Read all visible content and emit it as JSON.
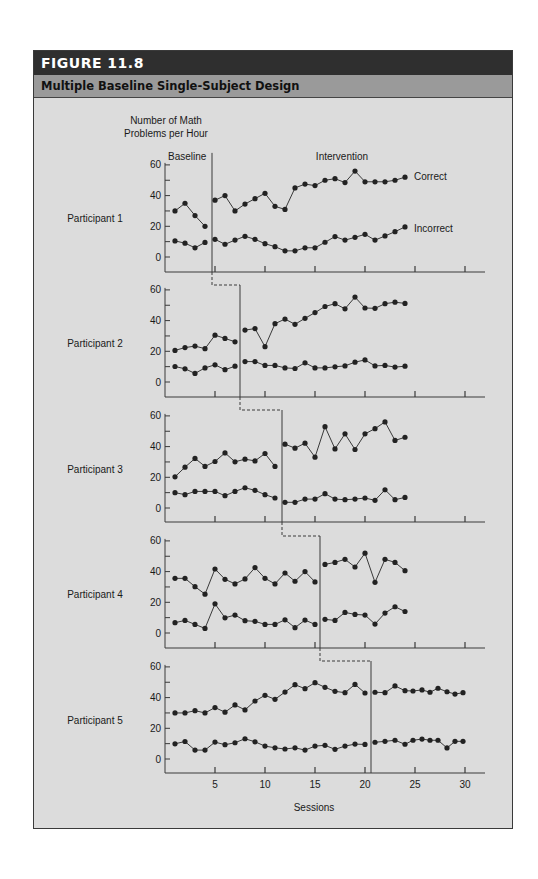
{
  "figure": {
    "number_label": "FIGURE  11.8",
    "title": "Multiple Baseline Single-Subject Design"
  },
  "chart_data": {
    "type": "line",
    "title": "Multiple Baseline Single-Subject Design",
    "ylabel": "Number of Math Problems per Hour",
    "ylabel_lines": [
      "Number of Math",
      "Problems per Hour"
    ],
    "xlabel": "Sessions",
    "xticks": [
      5,
      10,
      15,
      20,
      25,
      30
    ],
    "yticks": [
      0,
      20,
      40,
      60
    ],
    "ylim": [
      0,
      60
    ],
    "xlim": [
      0,
      32
    ],
    "grid": false,
    "phase_labels": [
      "Baseline",
      "Intervention"
    ],
    "series_labels": [
      "Correct",
      "Incorrect"
    ],
    "panels": [
      {
        "label": "Participant 1",
        "phase_change_after_session": 4.7,
        "correct": {
          "baseline": [
            [
              1,
              30
            ],
            [
              2,
              35
            ],
            [
              3,
              27
            ],
            [
              4,
              20
            ]
          ],
          "intervention": [
            [
              5,
              37
            ],
            [
              6,
              40
            ],
            [
              7,
              30
            ],
            [
              8,
              34.5
            ],
            [
              9,
              38
            ],
            [
              10,
              41.5
            ],
            [
              11,
              33
            ],
            [
              12,
              31
            ],
            [
              13,
              45
            ],
            [
              14,
              47.5
            ],
            [
              15,
              46.5
            ],
            [
              16,
              50
            ],
            [
              17,
              51
            ],
            [
              18,
              48.5
            ],
            [
              19,
              56
            ],
            [
              20,
              49
            ],
            [
              21,
              49
            ],
            [
              22,
              49
            ],
            [
              23,
              50
            ],
            [
              24,
              52
            ]
          ]
        },
        "incorrect": {
          "baseline": [
            [
              1,
              10.5
            ],
            [
              2,
              9
            ],
            [
              3,
              6
            ],
            [
              4,
              9.5
            ]
          ],
          "intervention": [
            [
              5,
              11.5
            ],
            [
              6,
              8.3
            ],
            [
              7,
              11
            ],
            [
              8,
              13.5
            ],
            [
              9,
              11.5
            ],
            [
              10,
              8.7
            ],
            [
              11,
              6.7
            ],
            [
              12,
              4
            ],
            [
              13,
              4
            ],
            [
              14,
              6
            ],
            [
              15,
              6
            ],
            [
              16,
              9.6
            ],
            [
              17,
              13.3
            ],
            [
              18,
              11
            ],
            [
              19,
              12.8
            ],
            [
              20,
              14.8
            ],
            [
              21,
              11
            ],
            [
              22,
              13.7
            ],
            [
              23,
              16.5
            ],
            [
              24,
              19.6
            ]
          ]
        }
      },
      {
        "label": "Participant 2",
        "phase_change_after_session": 7.5,
        "correct": {
          "baseline": [
            [
              1,
              20.6
            ],
            [
              2,
              22.4
            ],
            [
              3,
              23.4
            ],
            [
              4,
              21.7
            ],
            [
              5,
              30.5
            ],
            [
              6,
              28.4
            ],
            [
              7,
              26.2
            ]
          ],
          "intervention": [
            [
              8,
              33.8
            ],
            [
              9,
              34.8
            ],
            [
              10,
              23
            ],
            [
              11,
              38
            ],
            [
              12,
              41
            ],
            [
              13,
              37.6
            ],
            [
              14,
              41.5
            ],
            [
              15,
              45.2
            ],
            [
              16,
              49.2
            ],
            [
              17,
              51
            ],
            [
              18,
              47.7
            ],
            [
              19,
              55.3
            ],
            [
              20,
              48.2
            ],
            [
              21,
              48
            ],
            [
              22,
              51
            ],
            [
              23,
              52
            ],
            [
              24,
              51.2
            ]
          ]
        },
        "incorrect": {
          "baseline": [
            [
              1,
              10.1
            ],
            [
              2,
              8.6
            ],
            [
              3,
              5.6
            ],
            [
              4,
              9.2
            ],
            [
              5,
              11.2
            ],
            [
              6,
              8
            ],
            [
              7,
              10.3
            ]
          ],
          "intervention": [
            [
              8,
              13.3
            ],
            [
              9,
              13.3
            ],
            [
              10,
              10.8
            ],
            [
              11,
              10.8
            ],
            [
              12,
              9.2
            ],
            [
              13,
              8.8
            ],
            [
              14,
              12.5
            ],
            [
              15,
              9.2
            ],
            [
              16,
              9.2
            ],
            [
              17,
              9.9
            ],
            [
              18,
              10.5
            ],
            [
              19,
              12.9
            ],
            [
              20,
              14.4
            ],
            [
              21,
              10.5
            ],
            [
              22,
              10.8
            ],
            [
              23,
              9.7
            ],
            [
              24,
              10.3
            ]
          ]
        }
      },
      {
        "label": "Participant 3",
        "phase_change_after_session": 11.7,
        "correct": {
          "baseline": [
            [
              1,
              20.3
            ],
            [
              2,
              26.6
            ],
            [
              3,
              32.3
            ],
            [
              4,
              27.1
            ],
            [
              5,
              30.3
            ],
            [
              6,
              35.9
            ],
            [
              7,
              30.1
            ],
            [
              8,
              31.8
            ],
            [
              9,
              30.7
            ],
            [
              10,
              35.5
            ],
            [
              11,
              27.1
            ]
          ],
          "intervention": [
            [
              12,
              41.6
            ],
            [
              13,
              39
            ],
            [
              14,
              42.2
            ],
            [
              15,
              33.1
            ],
            [
              16,
              53
            ],
            [
              17,
              38.5
            ],
            [
              18,
              48.3
            ],
            [
              19,
              38.1
            ],
            [
              20,
              48.3
            ],
            [
              21,
              51.7
            ],
            [
              22,
              56.1
            ],
            [
              23,
              44
            ],
            [
              24,
              46.1
            ]
          ]
        },
        "incorrect": {
          "baseline": [
            [
              1,
              10
            ],
            [
              2,
              8.7
            ],
            [
              3,
              10.8
            ],
            [
              4,
              10.8
            ],
            [
              5,
              10.8
            ],
            [
              6,
              8
            ],
            [
              7,
              10.8
            ],
            [
              8,
              13.2
            ],
            [
              9,
              11.5
            ],
            [
              10,
              8.7
            ],
            [
              11,
              6.5
            ]
          ],
          "intervention": [
            [
              12,
              3.7
            ],
            [
              13,
              3.7
            ],
            [
              14,
              5.8
            ],
            [
              15,
              5.8
            ],
            [
              16,
              9.3
            ],
            [
              17,
              5.8
            ],
            [
              18,
              5.4
            ],
            [
              19,
              5.8
            ],
            [
              20,
              6.5
            ],
            [
              21,
              5
            ],
            [
              22,
              11.9
            ],
            [
              23,
              5.4
            ],
            [
              24,
              6.9
            ]
          ]
        }
      },
      {
        "label": "Participant 4",
        "phase_change_after_session": 15.5,
        "correct": {
          "baseline": [
            [
              1,
              35.6
            ],
            [
              2,
              35.6
            ],
            [
              3,
              30.2
            ],
            [
              4,
              25.3
            ],
            [
              5,
              41.7
            ],
            [
              6,
              35
            ],
            [
              7,
              32
            ],
            [
              8,
              35.2
            ],
            [
              9,
              42.6
            ],
            [
              10,
              35.6
            ],
            [
              11,
              32
            ],
            [
              12,
              39.1
            ],
            [
              13,
              33.7
            ],
            [
              14,
              40
            ],
            [
              15,
              33.3
            ]
          ],
          "intervention": [
            [
              16,
              44.7
            ],
            [
              17,
              46
            ],
            [
              18,
              48
            ],
            [
              19,
              43
            ],
            [
              20,
              52
            ],
            [
              21,
              33
            ],
            [
              22,
              48
            ],
            [
              23,
              46
            ],
            [
              24,
              40.6
            ]
          ]
        },
        "incorrect": {
          "baseline": [
            [
              1,
              6.7
            ],
            [
              2,
              8.2
            ],
            [
              3,
              5.6
            ],
            [
              4,
              3
            ],
            [
              5,
              19
            ],
            [
              6,
              9.9
            ],
            [
              7,
              11.7
            ],
            [
              8,
              8
            ],
            [
              9,
              7.6
            ],
            [
              10,
              5.6
            ],
            [
              11,
              5.6
            ],
            [
              12,
              8.6
            ],
            [
              13,
              3.5
            ],
            [
              14,
              8.4
            ],
            [
              15,
              5.6
            ]
          ],
          "intervention": [
            [
              16,
              8.9
            ],
            [
              17,
              8.2
            ],
            [
              18,
              13.4
            ],
            [
              19,
              12.1
            ],
            [
              20,
              11.7
            ],
            [
              21,
              5.8
            ],
            [
              22,
              13
            ],
            [
              23,
              17.1
            ],
            [
              24,
              14
            ]
          ]
        }
      },
      {
        "label": "Participant 5",
        "phase_change_after_session": 20.6,
        "correct": {
          "baseline": [
            [
              1,
              30
            ],
            [
              2,
              30
            ],
            [
              3,
              31.5
            ],
            [
              4,
              30
            ],
            [
              5,
              33.5
            ],
            [
              6,
              30.5
            ],
            [
              7,
              35.2
            ],
            [
              8,
              32
            ],
            [
              9,
              37.8
            ],
            [
              10,
              41.5
            ],
            [
              11,
              38.9
            ],
            [
              12,
              43.6
            ],
            [
              13,
              48.4
            ],
            [
              14,
              45.8
            ],
            [
              15,
              49.7
            ],
            [
              16,
              46.7
            ],
            [
              17,
              44.1
            ],
            [
              18,
              43.2
            ],
            [
              19,
              48.6
            ],
            [
              20,
              43
            ]
          ],
          "intervention": [
            [
              21,
              43.5
            ],
            [
              22,
              43.2
            ],
            [
              23,
              47.6
            ],
            [
              24,
              44.5
            ],
            [
              24.8,
              44.3
            ],
            [
              25.7,
              45
            ],
            [
              26.5,
              43.5
            ],
            [
              27.3,
              46.1
            ],
            [
              28.2,
              43.8
            ],
            [
              29,
              42.3
            ],
            [
              29.8,
              43.2
            ]
          ]
        },
        "incorrect": {
          "baseline": [
            [
              1,
              9.9
            ],
            [
              2,
              11.4
            ],
            [
              3,
              5.8
            ],
            [
              4,
              5.8
            ],
            [
              5,
              11
            ],
            [
              6,
              9.3
            ],
            [
              7,
              10.6
            ],
            [
              8,
              13.2
            ],
            [
              9,
              11.2
            ],
            [
              10,
              8.4
            ],
            [
              11,
              7.3
            ],
            [
              12,
              6.5
            ],
            [
              13,
              7.3
            ],
            [
              14,
              5.8
            ],
            [
              15,
              8.4
            ],
            [
              16,
              8.9
            ],
            [
              17,
              6.3
            ],
            [
              18,
              8.4
            ],
            [
              19,
              9.7
            ],
            [
              20,
              9.5
            ]
          ],
          "intervention": [
            [
              21,
              10.9
            ],
            [
              22,
              11.5
            ],
            [
              23,
              12.2
            ],
            [
              24,
              9.6
            ],
            [
              24.8,
              12.2
            ],
            [
              25.7,
              13
            ],
            [
              26.5,
              12.2
            ],
            [
              27.3,
              12.2
            ],
            [
              28.2,
              7.2
            ],
            [
              29,
              11.5
            ],
            [
              29.8,
              11.5
            ]
          ]
        }
      }
    ]
  },
  "colors": {
    "header_bg": "#2f2f2f",
    "subtitle_bg": "#9a9a9a",
    "panel_bg": "#dcdcdc",
    "line": "#3a3a3a",
    "marker": "#222222"
  }
}
